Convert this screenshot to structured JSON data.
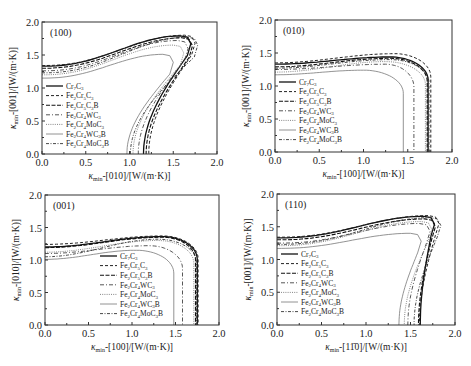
{
  "figure": {
    "panels": [
      "(100)",
      "(010)",
      "(001)",
      "(110)"
    ]
  },
  "chart_data": [
    {
      "type": "line",
      "title": "(100)",
      "xlabel": "κmin-[010]/[W/(m·K)]",
      "ylabel": "κmin-[001]/[W/(m·K)]",
      "xlim": [
        0,
        2.0
      ],
      "ylim": [
        0,
        2.0
      ],
      "xticks": [
        "0.0",
        "0.5",
        "1.0",
        "1.5",
        "2.0"
      ],
      "yticks": [
        "0.0",
        "0.5",
        "1.0",
        "1.5",
        "2.0"
      ],
      "grid": false,
      "legend_position": "lower-left",
      "box": {
        "x0": 42,
        "y0": 22,
        "x1": 217,
        "y1": 154
      },
      "legend": {
        "x": 46,
        "y": 86
      },
      "series": [
        {
          "name": "Cr7C3",
          "style": "solid",
          "y0": 1.33,
          "x0": 1.16,
          "peak": [
            1.58,
            1.79
          ],
          "shape": "hook"
        },
        {
          "name": "Fe2Cr5C3",
          "style": "dash",
          "y0": 1.34,
          "x0": 1.22,
          "peak": [
            1.63,
            1.8
          ],
          "shape": "hook"
        },
        {
          "name": "Fe2Cr5C3B",
          "style": "dashlong",
          "y0": 1.3,
          "x0": 1.19,
          "peak": [
            1.6,
            1.76
          ],
          "shape": "hook"
        },
        {
          "name": "Fe2Cr4WC3",
          "style": "dashdot",
          "y0": 1.26,
          "x0": 1.1,
          "peak": [
            1.55,
            1.72
          ],
          "shape": "hook"
        },
        {
          "name": "Fe2Cr4MoC3",
          "style": "dot",
          "y0": 1.2,
          "x0": 1.04,
          "peak": [
            1.5,
            1.65
          ],
          "shape": "hook"
        },
        {
          "name": "Fe2Cr4WC3B",
          "style": "solidthin",
          "y0": 1.15,
          "x0": 0.97,
          "peak": [
            1.38,
            1.51
          ],
          "shape": "hook"
        },
        {
          "name": "Fe2Cr4MoC3B",
          "style": "dashdotdot",
          "y0": 1.23,
          "x0": 1.01,
          "peak": [
            1.66,
            1.77
          ],
          "shape": "hook"
        }
      ]
    },
    {
      "type": "line",
      "title": "(010)",
      "xlabel": "κmin-[100]/[W/(m·K)]",
      "ylabel": "κmin-[001]/[W/(m·K)]",
      "xlim": [
        0,
        2.0
      ],
      "ylim": [
        0,
        2.0
      ],
      "xticks": [
        "0.0",
        "0.5",
        "1.0",
        "1.5",
        "2.0"
      ],
      "yticks": [
        "0.0",
        "0.5",
        "1.0",
        "1.5",
        "2.0"
      ],
      "grid": false,
      "legend_position": "lower-left",
      "box": {
        "x0": 275,
        "y0": 20,
        "x1": 452,
        "y1": 152
      },
      "legend": {
        "x": 279,
        "y": 82
      },
      "series": [
        {
          "name": "Cr7C3",
          "style": "solid",
          "y0": 1.33,
          "x0": 1.73,
          "peak": [
            1.3,
            1.44
          ],
          "shape": "box"
        },
        {
          "name": "Fe2Cr5C3",
          "style": "dash",
          "y0": 1.35,
          "x0": 1.76,
          "peak": [
            1.35,
            1.49
          ],
          "shape": "box"
        },
        {
          "name": "Fe2Cr5C3B",
          "style": "dashlong",
          "y0": 1.29,
          "x0": 1.72,
          "peak": [
            1.3,
            1.42
          ],
          "shape": "box"
        },
        {
          "name": "Fe2Cr4WC3",
          "style": "dashdot",
          "y0": 1.25,
          "x0": 1.57,
          "peak": [
            1.25,
            1.33
          ],
          "shape": "box"
        },
        {
          "name": "Fe2Cr4MoC3",
          "style": "dot",
          "y0": 1.21,
          "x0": 1.7,
          "peak": [
            1.25,
            1.37
          ],
          "shape": "box"
        },
        {
          "name": "Fe2Cr4WC3B",
          "style": "solidthin",
          "y0": 1.17,
          "x0": 1.45,
          "peak": [
            1.0,
            1.24
          ],
          "shape": "box"
        },
        {
          "name": "Fe2Cr4MoC3B",
          "style": "dashdotdot",
          "y0": 1.27,
          "x0": 1.74,
          "peak": [
            1.3,
            1.4
          ],
          "shape": "box"
        }
      ]
    },
    {
      "type": "line",
      "title": "(001)",
      "xlabel": "κmin-[100]/[W/(m·K)]",
      "ylabel": "κmin-[010]/[W/(m·K)]",
      "xlim": [
        0,
        2.0
      ],
      "ylim": [
        0,
        2.0
      ],
      "xticks": [
        "0.0",
        "0.5",
        "1.0",
        "1.5",
        "2.0"
      ],
      "yticks": [
        "0.0",
        "0.5",
        "1.0",
        "1.5",
        "2.0"
      ],
      "grid": false,
      "legend_position": "lower-center",
      "box": {
        "x0": 45,
        "y0": 195,
        "x1": 219,
        "y1": 325
      },
      "legend": {
        "x": 100,
        "y": 256
      },
      "series": [
        {
          "name": "Cr7C3",
          "style": "solid",
          "y0": 1.2,
          "x0": 1.75,
          "peak": [
            1.35,
            1.36
          ],
          "shape": "box"
        },
        {
          "name": "Fe2Cr5C3",
          "style": "dash",
          "y0": 1.24,
          "x0": 1.76,
          "peak": [
            1.35,
            1.37
          ],
          "shape": "box"
        },
        {
          "name": "Fe2Cr5C3B",
          "style": "dashlong",
          "y0": 1.19,
          "x0": 1.73,
          "peak": [
            1.35,
            1.35
          ],
          "shape": "box"
        },
        {
          "name": "Fe2Cr4WC3",
          "style": "dashdot",
          "y0": 1.1,
          "x0": 1.58,
          "peak": [
            1.2,
            1.22
          ],
          "shape": "box"
        },
        {
          "name": "Fe2Cr4MoC3",
          "style": "dot",
          "y0": 1.12,
          "x0": 1.71,
          "peak": [
            1.3,
            1.3
          ],
          "shape": "box"
        },
        {
          "name": "Fe2Cr4WC3B",
          "style": "solidthin",
          "y0": 1.01,
          "x0": 1.48,
          "peak": [
            1.05,
            1.15
          ],
          "shape": "box"
        },
        {
          "name": "Fe2Cr4MoC3B",
          "style": "dashdotdot",
          "y0": 1.05,
          "x0": 1.74,
          "peak": [
            1.3,
            1.32
          ],
          "shape": "box"
        }
      ]
    },
    {
      "type": "line",
      "title": "(110)",
      "xlabel": "κmin-[11̄0]/[W/(m·K)]",
      "ylabel": "κmin-[001]/[W/(m·K)]",
      "xlim": [
        0,
        2.0
      ],
      "ylim": [
        0,
        2.0
      ],
      "xticks": [
        "0.0",
        "0.5",
        "1.0",
        "1.5",
        "2.0"
      ],
      "yticks": [
        "0.0",
        "0.5",
        "1.0",
        "1.5",
        "2.0"
      ],
      "grid": false,
      "legend_position": "lower-left",
      "box": {
        "x0": 277,
        "y0": 194,
        "x1": 455,
        "y1": 325
      },
      "legend": {
        "x": 281,
        "y": 254
      },
      "series": [
        {
          "name": "Cr7C3",
          "style": "solid",
          "y0": 1.33,
          "x0": 1.61,
          "peak": [
            1.65,
            1.66
          ],
          "shape": "hook"
        },
        {
          "name": "Fe2Cr5C3",
          "style": "dash",
          "y0": 1.34,
          "x0": 1.6,
          "peak": [
            1.7,
            1.67
          ],
          "shape": "hook"
        },
        {
          "name": "Fe2Cr5C3B",
          "style": "dashlong",
          "y0": 1.3,
          "x0": 1.59,
          "peak": [
            1.66,
            1.62
          ],
          "shape": "hook"
        },
        {
          "name": "Fe2Cr4WC3",
          "style": "dashdot",
          "y0": 1.25,
          "x0": 1.47,
          "peak": [
            1.6,
            1.55
          ],
          "shape": "hook"
        },
        {
          "name": "Fe2Cr4MoC3",
          "style": "dot",
          "y0": 1.21,
          "x0": 1.43,
          "peak": [
            1.62,
            1.58
          ],
          "shape": "hook"
        },
        {
          "name": "Fe2Cr4WC3B",
          "style": "solidthin",
          "y0": 1.17,
          "x0": 1.37,
          "peak": [
            1.5,
            1.4
          ],
          "shape": "hook"
        },
        {
          "name": "Fe2Cr4MoC3B",
          "style": "dashdotdot",
          "y0": 1.23,
          "x0": 1.54,
          "peak": [
            1.72,
            1.64
          ],
          "shape": "hook"
        }
      ]
    }
  ]
}
